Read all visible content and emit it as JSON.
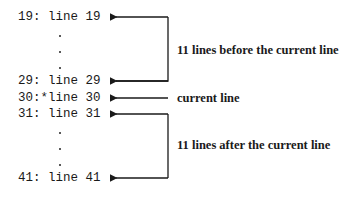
{
  "lines": {
    "l19": "19: line 19",
    "l29": "29: line 29",
    "l30": "30:*line 30",
    "l31": "31: line 31",
    "l41": "41: line 41"
  },
  "labels": {
    "before": "11 lines before the current line",
    "current": "current line",
    "after": "11 lines after the current line"
  }
}
